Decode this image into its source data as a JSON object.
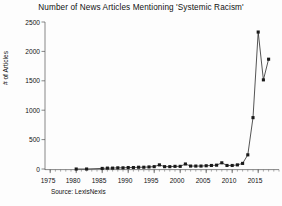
{
  "chart_data": {
    "type": "line",
    "title": "Number of News Articles Mentioning 'Systemic Racism'",
    "xlabel": "",
    "ylabel": "# of Articles",
    "source": "Source: LexisNexis",
    "xlim": [
      1974,
      1919
    ],
    "x_axis_range": [
      1974,
      2019
    ],
    "ylim": [
      0,
      2500
    ],
    "grid": false,
    "legend": false,
    "marker": "filled-square",
    "line_color": "#222222",
    "marker_color": "#1a1a1a",
    "yticks": [
      0,
      500,
      1000,
      1500,
      2000,
      2500
    ],
    "ytick_labels": [
      "0",
      "500",
      "1000",
      "1500",
      "2000",
      "2500"
    ],
    "xticks": [
      1975,
      1980,
      1985,
      1990,
      1995,
      2000,
      2005,
      2010,
      2015
    ],
    "xtick_labels": [
      "1975",
      "1980",
      "1985",
      "1990",
      "1995",
      "2000",
      "2005",
      "2010",
      "2015"
    ],
    "x": [
      1980,
      1982,
      1985,
      1986,
      1987,
      1988,
      1989,
      1990,
      1991,
      1992,
      1993,
      1994,
      1995,
      1996,
      1997,
      1998,
      1999,
      2000,
      2001,
      2002,
      2003,
      2004,
      2005,
      2006,
      2007,
      2008,
      2009,
      2010,
      2011,
      2012,
      2013,
      2014,
      2015,
      2016
    ],
    "values": [
      10,
      10,
      20,
      25,
      25,
      30,
      30,
      35,
      35,
      40,
      40,
      45,
      50,
      80,
      50,
      50,
      55,
      55,
      95,
      60,
      60,
      60,
      65,
      70,
      75,
      115,
      70,
      70,
      80,
      105,
      250,
      880,
      2330,
      1520
    ],
    "annotations": [
      {
        "text": "flat near zero from 1980 through 2011",
        "x": 1995,
        "y": 60
      },
      {
        "text": "steep rise begins 2012",
        "x": 2013,
        "y": 880
      },
      {
        "text": "peak 2015",
        "x": 2015,
        "y": 2330
      },
      {
        "text": "dip 2016",
        "x": 2016,
        "y": 1520
      },
      {
        "text": "final point",
        "x": 2017,
        "y": 1870
      }
    ],
    "extra_points": [
      {
        "x": 2017,
        "y": 1870
      }
    ]
  },
  "chart_meta": {
    "title": "Number of News Articles Mentioning 'Systemic Racism'",
    "ylabel": "# of Articles",
    "source": "Source: LexisNexis"
  }
}
